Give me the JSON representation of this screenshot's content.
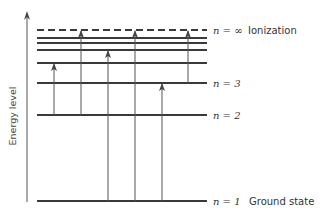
{
  "diagram": {
    "axis_label": "Energy level",
    "colors": {
      "line": "#3a3a3a",
      "arrow": "#555555",
      "text": "#333333",
      "background": "#ffffff"
    },
    "levels": [
      {
        "id": "n1",
        "n_label": "n = 1",
        "desc": "Ground state",
        "y": 201,
        "style": "solid"
      },
      {
        "id": "n2",
        "n_label": "n = 2",
        "desc": "",
        "y": 115,
        "style": "solid"
      },
      {
        "id": "n3",
        "n_label": "n = 3",
        "desc": "",
        "y": 83,
        "style": "solid"
      },
      {
        "id": "n4",
        "n_label": "",
        "desc": "",
        "y": 63,
        "style": "solid"
      },
      {
        "id": "n5",
        "n_label": "",
        "desc": "",
        "y": 50,
        "style": "solid"
      },
      {
        "id": "n6",
        "n_label": "",
        "desc": "",
        "y": 43,
        "style": "solid"
      },
      {
        "id": "n7",
        "n_label": "",
        "desc": "",
        "y": 38,
        "style": "solid"
      },
      {
        "id": "ninf",
        "n_label": "n = ∞",
        "desc": "Ionization",
        "y": 30,
        "style": "dashed"
      }
    ],
    "transitions": [
      {
        "x": 54,
        "from": "n2",
        "to": "n4"
      },
      {
        "x": 81,
        "from": "n2",
        "to": "ninf"
      },
      {
        "x": 108,
        "from": "n1",
        "to": "n5"
      },
      {
        "x": 135,
        "from": "n1",
        "to": "ninf"
      },
      {
        "x": 162,
        "from": "n1",
        "to": "n3"
      },
      {
        "x": 188,
        "from": "n3",
        "to": "ninf"
      }
    ],
    "labels": {
      "inf_n": "n = ∞",
      "inf_desc": "Ionization",
      "n3": "n = 3",
      "n2": "n = 2",
      "n1": "n = 1",
      "n1_desc": "Ground state"
    }
  }
}
